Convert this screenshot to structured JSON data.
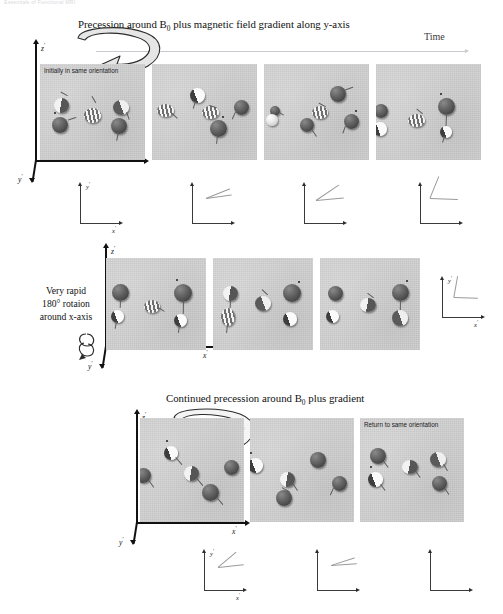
{
  "running_head": "Essentials of Functional MRI",
  "sections": {
    "top": {
      "title_pre": "Precession around B",
      "title_sub": "0",
      "title_post": " plus magnetic field gradient along y-axis",
      "time_label": "Time",
      "first_panel_note": "Initially in same orientation",
      "axes": {
        "z": "z",
        "x": "x",
        "y": "y",
        "prime": "′"
      }
    },
    "middle": {
      "caption_line1": "Very rapid",
      "caption_line2": "180° rotaion",
      "caption_line3": "around x-axis",
      "axes": {
        "z": "z",
        "x": "x",
        "y": "y",
        "prime": "′"
      }
    },
    "bottom": {
      "title_pre": "Continued precession around B",
      "title_sub": "0",
      "title_post": " plus gradient",
      "last_panel_note": "Return to same orientation",
      "axes": {
        "z": "z",
        "x": "x",
        "y": "y",
        "prime": "′"
      }
    }
  },
  "mini_axes": {
    "row1": [
      {
        "y_label": "y",
        "x_label": "x",
        "show_labels": true,
        "fan": []
      },
      {
        "y_label": "y",
        "x_label": "x",
        "show_labels": false,
        "fan": [
          -8,
          -22
        ]
      },
      {
        "y_label": "y",
        "x_label": "x",
        "show_labels": false,
        "fan": [
          -5,
          -34
        ]
      },
      {
        "y_label": "y",
        "x_label": "x",
        "show_labels": false,
        "fan": [
          2,
          -46
        ]
      }
    ],
    "row2": [
      {
        "y_label": "y",
        "x_label": "x",
        "show_labels": true,
        "fan": [
          2,
          8
        ]
      }
    ],
    "row3": [
      {
        "y_label": "y",
        "x_label": "x",
        "show_labels": true,
        "fan": [
          -6,
          -20
        ]
      },
      {
        "y_label": "y",
        "x_label": "x",
        "show_labels": false,
        "fan": [
          -4,
          -16
        ]
      },
      {
        "y_label": "y",
        "x_label": "x",
        "show_labels": false,
        "fan": []
      }
    ]
  },
  "colors": {
    "panel_bg": "#d2d2d2",
    "axis": "#111111",
    "time_axis": "#c9c9cf",
    "spin_dark": "#4a4a4a",
    "spin_light": "#f0f0f0",
    "text": "#1a1a1a"
  }
}
